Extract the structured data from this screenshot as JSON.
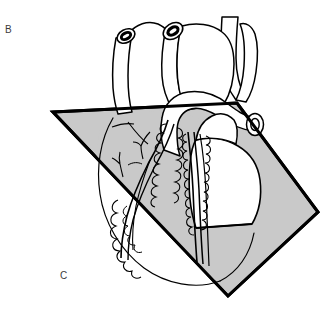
{
  "figure": {
    "background_color": "#ffffff",
    "width": 333,
    "height": 313
  },
  "labels": {
    "panel_b": "B",
    "panel_c": "C"
  },
  "colors": {
    "plane_fill": "#c9c9c9",
    "plane_stroke": "#000000",
    "organ_stroke": "#000000",
    "organ_fill": "#ffffff",
    "shaded_organ_fill": "#c9c9c9",
    "label_text": "#3b3b3b",
    "vessel_lumen": "#ffffff",
    "vessel_ring": "#1a1a1a"
  },
  "geometry": {
    "plane_points": "53,112 237,103 318,212 228,296",
    "plane_stroke_width": 3,
    "organ_stroke_width": 1.4,
    "fine_stroke_width": 1.0
  },
  "structures": [
    {
      "name": "cut-plane",
      "kind": "section-plane",
      "shaded": true
    },
    {
      "name": "aortic-arch",
      "kind": "great-vessel",
      "shaded": false
    },
    {
      "name": "pulmonary-trunk",
      "kind": "great-vessel",
      "shaded": false
    },
    {
      "name": "superior-vena-cava",
      "kind": "great-vessel",
      "shaded": false
    },
    {
      "name": "pulmonary-vein-stump-left",
      "kind": "cut-vessel-stump",
      "shaded": false
    },
    {
      "name": "pulmonary-vein-stump-right",
      "kind": "cut-vessel-stump",
      "shaded": false
    },
    {
      "name": "aorta-cut-end",
      "kind": "cut-vessel-stump",
      "shaded": false
    },
    {
      "name": "left-atrial-appendage",
      "kind": "chamber",
      "shaded": true
    },
    {
      "name": "left-ventricle",
      "kind": "chamber",
      "shaded": true
    },
    {
      "name": "right-ventricle",
      "kind": "chamber",
      "shaded": false
    },
    {
      "name": "anterior-interventricular-artery",
      "kind": "coronary-artery",
      "shaded": false
    },
    {
      "name": "circumflex-artery",
      "kind": "coronary-artery",
      "shaded": false
    },
    {
      "name": "epicardial-fat",
      "kind": "adipose-tissue",
      "shaded": false
    }
  ]
}
